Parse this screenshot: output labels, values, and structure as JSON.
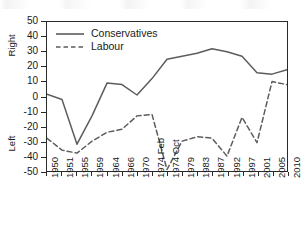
{
  "figure": {
    "title": "",
    "background_color": "#ffffff",
    "frame_color": "#2a2a2a"
  },
  "chart_data": {
    "type": "line",
    "title": "",
    "subtitle": "",
    "xlabel": "",
    "ylabel": "",
    "ylabel_top": "Right",
    "ylabel_bottom": "Left",
    "ylim": [
      -50,
      50
    ],
    "yticks": [
      50,
      40,
      30,
      20,
      10,
      0,
      -10,
      -20,
      -30,
      -40,
      -50
    ],
    "ytick_labels": [
      "50",
      "40",
      "30",
      "20",
      "10",
      "0",
      "-10",
      "-20",
      "-30",
      "-40",
      "-50"
    ],
    "grid": false,
    "legend_position": "upper-left",
    "categories": [
      "1950",
      "1951",
      "1955",
      "1959",
      "1964",
      "1966",
      "1970",
      "1974 Feb",
      "1974 Oct",
      "1979",
      "1983",
      "1987",
      "1992",
      "1997",
      "2001",
      "2005",
      "2010"
    ],
    "series": [
      {
        "name": "Conservatives",
        "style": "solid",
        "color": "#5c5c5c",
        "values": [
          1.5,
          -2,
          -32,
          -13,
          9,
          8,
          1,
          12,
          25,
          27,
          29,
          32,
          30,
          27,
          16,
          15,
          18
        ]
      },
      {
        "name": "Labour",
        "style": "dashed",
        "color": "#5c5c5c",
        "values": [
          -28,
          -36,
          -38,
          -30,
          -24,
          -22,
          -13,
          -12,
          -49,
          -30,
          -27,
          -28,
          -40,
          -14,
          -31,
          10,
          8
        ]
      }
    ],
    "series_note": "Labour values are plotted against the same category axis; the Labour line is dashed and the Conservatives line is solid."
  },
  "legend": {
    "items": [
      {
        "label": "Conservatives",
        "style": "solid"
      },
      {
        "label": "Labour",
        "style": "dashed"
      }
    ]
  }
}
